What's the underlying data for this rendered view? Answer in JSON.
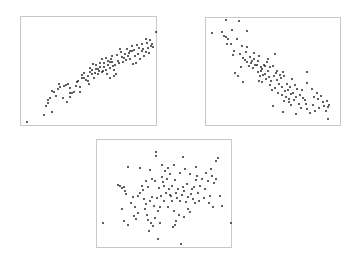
{
  "chart_data": [
    {
      "type": "scatter",
      "title": "",
      "xlabel": "",
      "ylabel": "",
      "grid": false,
      "legend": null,
      "description": "Strong positive correlation",
      "frame": {
        "left": 20,
        "top": 16,
        "width": 137,
        "height": 110
      },
      "points": [
        [
          5,
          104
        ],
        [
          22,
          97
        ],
        [
          24,
          88
        ],
        [
          26,
          85
        ],
        [
          26,
          82
        ],
        [
          28,
          80
        ],
        [
          30,
          73
        ],
        [
          32,
          74
        ],
        [
          36,
          71
        ],
        [
          38,
          69
        ],
        [
          37,
          66
        ],
        [
          42,
          68
        ],
        [
          44,
          67
        ],
        [
          46,
          66
        ],
        [
          48,
          70
        ],
        [
          48,
          75
        ],
        [
          50,
          75
        ],
        [
          52,
          74
        ],
        [
          54,
          68
        ],
        [
          55,
          64
        ],
        [
          56,
          63
        ],
        [
          58,
          69
        ],
        [
          60,
          60
        ],
        [
          60,
          57
        ],
        [
          62,
          60
        ],
        [
          62,
          55
        ],
        [
          64,
          62
        ],
        [
          66,
          63
        ],
        [
          66,
          58
        ],
        [
          68,
          54
        ],
        [
          68,
          50
        ],
        [
          70,
          56
        ],
        [
          70,
          52
        ],
        [
          71,
          46
        ],
        [
          72,
          60
        ],
        [
          73,
          55
        ],
        [
          74,
          51
        ],
        [
          74,
          47
        ],
        [
          76,
          51
        ],
        [
          76,
          56
        ],
        [
          78,
          45
        ],
        [
          78,
          49
        ],
        [
          80,
          41
        ],
        [
          80,
          54
        ],
        [
          81,
          53
        ],
        [
          82,
          49
        ],
        [
          82,
          45
        ],
        [
          84,
          40
        ],
        [
          84,
          52
        ],
        [
          85,
          56
        ],
        [
          86,
          43
        ],
        [
          86,
          47
        ],
        [
          88,
          44
        ],
        [
          88,
          50
        ],
        [
          88,
          60
        ],
        [
          90,
          38
        ],
        [
          90,
          44
        ],
        [
          91,
          48
        ],
        [
          92,
          52
        ],
        [
          93,
          47
        ],
        [
          94,
          56
        ],
        [
          95,
          37
        ],
        [
          96,
          43
        ],
        [
          97,
          45
        ],
        [
          99,
          34
        ],
        [
          100,
          39
        ],
        [
          101,
          44
        ],
        [
          102,
          40
        ],
        [
          103,
          36
        ],
        [
          104,
          42
        ],
        [
          105,
          31
        ],
        [
          106,
          38
        ],
        [
          107,
          35
        ],
        [
          108,
          41
        ],
        [
          110,
          33
        ],
        [
          110,
          28
        ],
        [
          111,
          46
        ],
        [
          112,
          32
        ],
        [
          113,
          38
        ],
        [
          114,
          45
        ],
        [
          115,
          27
        ],
        [
          116,
          36
        ],
        [
          117,
          30
        ],
        [
          118,
          41
        ],
        [
          120,
          26
        ],
        [
          120,
          33
        ],
        [
          121,
          31
        ],
        [
          122,
          38
        ],
        [
          124,
          21
        ],
        [
          124,
          34
        ],
        [
          125,
          25
        ],
        [
          126,
          30
        ],
        [
          127,
          35
        ],
        [
          128,
          22
        ],
        [
          129,
          28
        ],
        [
          130,
          26
        ],
        [
          131,
          29
        ],
        [
          136,
          14
        ],
        [
          108,
          33
        ],
        [
          98,
          31
        ],
        [
          77,
          53
        ],
        [
          89,
          41
        ],
        [
          67,
          66
        ],
        [
          58,
          74
        ],
        [
          48,
          79
        ],
        [
          45,
          84
        ],
        [
          41,
          80
        ],
        [
          34,
          78
        ],
        [
          30,
          94
        ],
        [
          92,
          58
        ]
      ]
    },
    {
      "type": "scatter",
      "title": "",
      "xlabel": "",
      "ylabel": "",
      "grid": false,
      "legend": null,
      "description": "Moderate negative correlation",
      "frame": {
        "left": 205,
        "top": 17,
        "width": 136,
        "height": 109
      },
      "points": [
        [
          5,
          14
        ],
        [
          19,
          1
        ],
        [
          32,
          2
        ],
        [
          40,
          12
        ],
        [
          15,
          13
        ],
        [
          17,
          17
        ],
        [
          19,
          18
        ],
        [
          21,
          20
        ],
        [
          20,
          25
        ],
        [
          25,
          11
        ],
        [
          24,
          25
        ],
        [
          30,
          20
        ],
        [
          27,
          32
        ],
        [
          26,
          36
        ],
        [
          33,
          35
        ],
        [
          35,
          27
        ],
        [
          36,
          39
        ],
        [
          38,
          41
        ],
        [
          39,
          33
        ],
        [
          40,
          43
        ],
        [
          40,
          28
        ],
        [
          42,
          47
        ],
        [
          43,
          38
        ],
        [
          44,
          44
        ],
        [
          45,
          42
        ],
        [
          46,
          49
        ],
        [
          47,
          34
        ],
        [
          47,
          40
        ],
        [
          48,
          46
        ],
        [
          50,
          46
        ],
        [
          51,
          42
        ],
        [
          51,
          53
        ],
        [
          52,
          37
        ],
        [
          52,
          62
        ],
        [
          53,
          57
        ],
        [
          54,
          48
        ],
        [
          54,
          52
        ],
        [
          55,
          50
        ],
        [
          55,
          63
        ],
        [
          56,
          56
        ],
        [
          57,
          46
        ],
        [
          58,
          55
        ],
        [
          58,
          47
        ],
        [
          59,
          60
        ],
        [
          60,
          43
        ],
        [
          61,
          52
        ],
        [
          61,
          40
        ],
        [
          62,
          58
        ],
        [
          63,
          66
        ],
        [
          63,
          48
        ],
        [
          64,
          62
        ],
        [
          65,
          71
        ],
        [
          66,
          47
        ],
        [
          67,
          57
        ],
        [
          68,
          69
        ],
        [
          68,
          35
        ],
        [
          69,
          54
        ],
        [
          70,
          61
        ],
        [
          70,
          52
        ],
        [
          71,
          74
        ],
        [
          72,
          65
        ],
        [
          73,
          56
        ],
        [
          74,
          59
        ],
        [
          75,
          76
        ],
        [
          75,
          68
        ],
        [
          76,
          53
        ],
        [
          77,
          82
        ],
        [
          77,
          57
        ],
        [
          78,
          72
        ],
        [
          79,
          78
        ],
        [
          80,
          65
        ],
        [
          81,
          71
        ],
        [
          82,
          83
        ],
        [
          82,
          80
        ],
        [
          83,
          68
        ],
        [
          84,
          86
        ],
        [
          84,
          75
        ],
        [
          85,
          60
        ],
        [
          86,
          74
        ],
        [
          87,
          81
        ],
        [
          88,
          66
        ],
        [
          89,
          78
        ],
        [
          90,
          70
        ],
        [
          92,
          85
        ],
        [
          93,
          76
        ],
        [
          94,
          89
        ],
        [
          95,
          71
        ],
        [
          96,
          79
        ],
        [
          98,
          81
        ],
        [
          99,
          85
        ],
        [
          100,
          64
        ],
        [
          100,
          90
        ],
        [
          103,
          94
        ],
        [
          105,
          70
        ],
        [
          106,
          86
        ],
        [
          107,
          78
        ],
        [
          108,
          92
        ],
        [
          110,
          74
        ],
        [
          111,
          80
        ],
        [
          112,
          89
        ],
        [
          114,
          77
        ],
        [
          116,
          83
        ],
        [
          117,
          87
        ],
        [
          119,
          92
        ],
        [
          120,
          82
        ],
        [
          121,
          88
        ],
        [
          122,
          86
        ],
        [
          76,
          93
        ],
        [
          66,
          87
        ],
        [
          89,
          95
        ],
        [
          28,
          54
        ],
        [
          31,
          57
        ],
        [
          36,
          63
        ],
        [
          34,
          48
        ],
        [
          100,
          53
        ],
        [
          121,
          100
        ]
      ]
    },
    {
      "type": "scatter",
      "title": "",
      "xlabel": "",
      "ylabel": "",
      "grid": false,
      "legend": null,
      "description": "No correlation",
      "frame": {
        "left": 96,
        "top": 139,
        "width": 136,
        "height": 109
      },
      "points": [
        [
          5,
          82
        ],
        [
          20,
          44
        ],
        [
          22,
          45
        ],
        [
          24,
          47
        ],
        [
          26,
          46
        ],
        [
          27,
          50
        ],
        [
          24,
          68
        ],
        [
          26,
          80
        ],
        [
          28,
          53
        ],
        [
          30,
          26
        ],
        [
          30,
          84
        ],
        [
          33,
          62
        ],
        [
          35,
          56
        ],
        [
          36,
          75
        ],
        [
          37,
          66
        ],
        [
          38,
          78
        ],
        [
          40,
          72
        ],
        [
          40,
          55
        ],
        [
          42,
          52
        ],
        [
          42,
          27
        ],
        [
          44,
          45
        ],
        [
          45,
          49
        ],
        [
          46,
          58
        ],
        [
          47,
          68
        ],
        [
          48,
          40
        ],
        [
          48,
          63
        ],
        [
          49,
          74
        ],
        [
          50,
          79
        ],
        [
          50,
          46
        ],
        [
          51,
          90
        ],
        [
          52,
          29
        ],
        [
          52,
          60
        ],
        [
          53,
          82
        ],
        [
          54,
          56
        ],
        [
          54,
          38
        ],
        [
          55,
          85
        ],
        [
          56,
          65
        ],
        [
          57,
          77
        ],
        [
          57,
          40
        ],
        [
          58,
          11
        ],
        [
          58,
          15
        ],
        [
          59,
          57
        ],
        [
          60,
          70
        ],
        [
          61,
          47
        ],
        [
          62,
          66
        ],
        [
          62,
          82
        ],
        [
          63,
          55
        ],
        [
          64,
          24
        ],
        [
          64,
          36
        ],
        [
          65,
          41
        ],
        [
          66,
          60
        ],
        [
          66,
          45
        ],
        [
          67,
          30
        ],
        [
          68,
          52
        ],
        [
          69,
          38
        ],
        [
          70,
          27
        ],
        [
          70,
          66
        ],
        [
          71,
          48
        ],
        [
          72,
          33
        ],
        [
          72,
          54
        ],
        [
          73,
          55
        ],
        [
          74,
          45
        ],
        [
          74,
          60
        ],
        [
          75,
          86
        ],
        [
          76,
          24
        ],
        [
          76,
          70
        ],
        [
          77,
          39
        ],
        [
          78,
          52
        ],
        [
          79,
          57
        ],
        [
          80,
          48
        ],
        [
          81,
          74
        ],
        [
          82,
          60
        ],
        [
          82,
          32
        ],
        [
          84,
          54
        ],
        [
          85,
          46
        ],
        [
          86,
          50
        ],
        [
          86,
          76
        ],
        [
          87,
          28
        ],
        [
          88,
          61
        ],
        [
          89,
          43
        ],
        [
          90,
          56
        ],
        [
          90,
          68
        ],
        [
          92,
          33
        ],
        [
          93,
          53
        ],
        [
          94,
          48
        ],
        [
          95,
          58
        ],
        [
          96,
          46
        ],
        [
          97,
          62
        ],
        [
          98,
          26
        ],
        [
          99,
          35
        ],
        [
          100,
          52
        ],
        [
          101,
          60
        ],
        [
          102,
          45
        ],
        [
          104,
          38
        ],
        [
          106,
          57
        ],
        [
          107,
          48
        ],
        [
          108,
          32
        ],
        [
          110,
          40
        ],
        [
          111,
          62
        ],
        [
          112,
          55
        ],
        [
          113,
          28
        ],
        [
          114,
          35
        ],
        [
          116,
          42
        ],
        [
          118,
          38
        ],
        [
          115,
          66
        ],
        [
          118,
          20
        ],
        [
          120,
          17
        ],
        [
          122,
          55
        ],
        [
          124,
          65
        ],
        [
          140,
          82
        ],
        [
          77,
          84
        ],
        [
          78,
          80
        ],
        [
          85,
          16
        ],
        [
          60,
          98
        ],
        [
          83,
          103
        ],
        [
          98,
          39
        ],
        [
          92,
          71
        ]
      ]
    }
  ]
}
